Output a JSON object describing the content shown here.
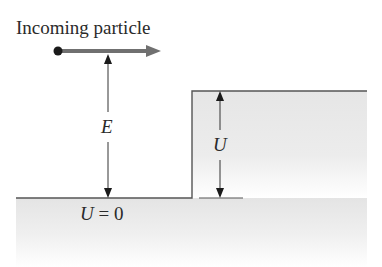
{
  "diagram": {
    "title": "Incoming particle",
    "labels": {
      "energy": "E",
      "barrier_height": "U",
      "ground_potential_var": "U",
      "ground_potential_eq": " = 0"
    },
    "colors": {
      "region_fill": "#e6e6e6",
      "line": "#555555",
      "particle_arrow": "#707070",
      "particle_dot": "#1a1a1a",
      "text": "#2a2a2a"
    },
    "geometry": {
      "ground_y": 198,
      "step_top_y": 91,
      "step_x": 192,
      "left_x": 16,
      "right_x": 367,
      "particle": {
        "x": 58,
        "y": 51,
        "arrow_end_x": 160
      },
      "energy_arrow_x": 108,
      "barrier_arrow_x": 220
    }
  }
}
